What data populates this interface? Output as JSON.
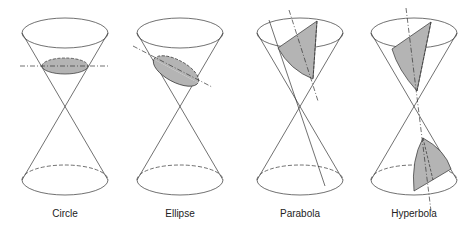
{
  "figure": {
    "panels": [
      {
        "id": "circle",
        "label": "Circle",
        "cx": 65
      },
      {
        "id": "ellipse",
        "label": "Ellipse",
        "cx": 180
      },
      {
        "id": "parabola",
        "label": "Parabola",
        "cx": 300
      },
      {
        "id": "hyperbola",
        "label": "Hyperbola",
        "cx": 414
      }
    ],
    "colors": {
      "line": "#333333",
      "shade": "#b4b4b4",
      "background": "#ffffff"
    }
  }
}
